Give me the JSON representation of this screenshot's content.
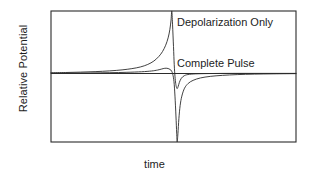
{
  "chart_data": {
    "type": "line",
    "title": "",
    "xlabel": "time",
    "ylabel": "Relative Potential",
    "grid": false,
    "axis_ticks": false,
    "legend_position": "inline-annotations",
    "frame": {
      "x0": 51,
      "y0": 11,
      "x1": 296,
      "y1": 142
    },
    "baseline_y_value": 0,
    "xlim": [
      0,
      1
    ],
    "ylim": [
      -1,
      1
    ],
    "line_color": "#2b2b2b",
    "line_width": 0.9,
    "annotations": [
      {
        "id": "depolarization-only-label",
        "text": "Depolarization Only",
        "x": 0.515,
        "y": 0.82
      },
      {
        "id": "complete-pulse-label",
        "text": "Complete Pulse",
        "x": 0.515,
        "y": 0.19
      }
    ],
    "series": [
      {
        "name": "Depolarization Only",
        "description": "Slow exponential rise to a sharp positive peak at the top of the frame, then an abrupt fall through baseline to a shallow negative dip, returning quickly to baseline.",
        "peak_x": 0.493,
        "peak_y": 1.0,
        "trough_x": 0.513,
        "trough_y": -0.22,
        "points_x": [
          0.0,
          0.06,
          0.12,
          0.18,
          0.24,
          0.29,
          0.33,
          0.365,
          0.395,
          0.42,
          0.44,
          0.455,
          0.468,
          0.478,
          0.485,
          0.49,
          0.493,
          0.496,
          0.5,
          0.503,
          0.506,
          0.509,
          0.512,
          0.515,
          0.519,
          0.524,
          0.532,
          0.545,
          0.565,
          0.6,
          0.66,
          0.74,
          0.84,
          1.0
        ],
        "points_y": [
          0.012,
          0.016,
          0.022,
          0.03,
          0.042,
          0.058,
          0.078,
          0.105,
          0.145,
          0.2,
          0.272,
          0.35,
          0.452,
          0.57,
          0.7,
          0.855,
          1.0,
          0.79,
          0.43,
          0.14,
          -0.04,
          -0.145,
          -0.2,
          -0.22,
          -0.19,
          -0.13,
          -0.07,
          -0.03,
          -0.012,
          -0.004,
          0.0,
          0.002,
          0.002,
          0.002
        ]
      },
      {
        "name": "Complete Pulse",
        "description": "Very small slow positive rise, a narrow shallow positive bump, then a deep negative spike reaching the bottom of the frame, followed by a slow exponential recovery back to baseline.",
        "bump_x": 0.47,
        "bump_y": 0.085,
        "trough_x": 0.515,
        "trough_y": -1.0,
        "points_x": [
          0.0,
          0.08,
          0.16,
          0.24,
          0.31,
          0.37,
          0.41,
          0.435,
          0.452,
          0.462,
          0.47,
          0.478,
          0.486,
          0.492,
          0.497,
          0.502,
          0.506,
          0.51,
          0.513,
          0.515,
          0.518,
          0.522,
          0.527,
          0.534,
          0.545,
          0.56,
          0.58,
          0.61,
          0.65,
          0.7,
          0.76,
          0.83,
          0.91,
          1.0
        ],
        "points_y": [
          0.004,
          0.006,
          0.009,
          0.013,
          0.019,
          0.028,
          0.04,
          0.055,
          0.072,
          0.082,
          0.085,
          0.08,
          0.065,
          0.04,
          -0.01,
          -0.12,
          -0.33,
          -0.62,
          -0.87,
          -1.0,
          -0.88,
          -0.66,
          -0.47,
          -0.33,
          -0.215,
          -0.145,
          -0.1,
          -0.065,
          -0.042,
          -0.027,
          -0.016,
          -0.009,
          -0.005,
          -0.002
        ]
      }
    ]
  },
  "axes": {
    "ylabel": "Relative Potential",
    "xlabel": "time"
  }
}
